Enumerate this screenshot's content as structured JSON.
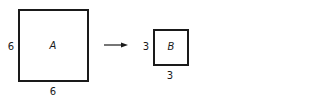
{
  "shapes": [
    {
      "id": "A",
      "name": "A",
      "side_label": "6",
      "bottom_label": "6"
    },
    {
      "id": "B",
      "name": "B",
      "side_label": "3",
      "bottom_label": "3"
    }
  ],
  "arrow": {
    "direction": "right",
    "meaning": "transforms to"
  }
}
